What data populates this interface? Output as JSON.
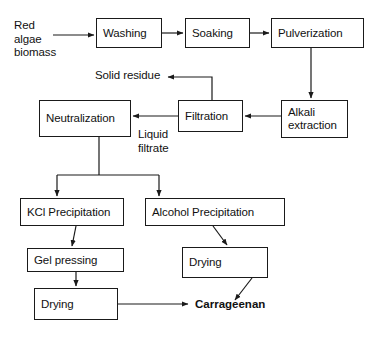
{
  "diagram": {
    "stroke_color": "#1a1a1a",
    "background_color": "#ffffff",
    "nodes": [
      {
        "id": "washing",
        "label": "Washing",
        "x": 96,
        "y": 18,
        "w": 66,
        "h": 30
      },
      {
        "id": "soaking",
        "label": "Soaking",
        "x": 185,
        "y": 18,
        "w": 65,
        "h": 30
      },
      {
        "id": "pulverization",
        "label": "Pulverization",
        "x": 271,
        "y": 18,
        "w": 93,
        "h": 30
      },
      {
        "id": "alkali",
        "label": "Alkali\nextraction",
        "x": 281,
        "y": 100,
        "w": 67,
        "h": 38
      },
      {
        "id": "filtration",
        "label": "Filtration",
        "x": 178,
        "y": 100,
        "w": 65,
        "h": 32
      },
      {
        "id": "neutralization",
        "label": "Neutralization",
        "x": 39,
        "y": 100,
        "w": 92,
        "h": 37
      },
      {
        "id": "kcl-precip",
        "label": "KCl Precipitation",
        "x": 20,
        "y": 198,
        "w": 104,
        "h": 28
      },
      {
        "id": "alcohol-precip",
        "label": "Alcohol Precipitation",
        "x": 145,
        "y": 198,
        "w": 140,
        "h": 28
      },
      {
        "id": "gel-pressing",
        "label": "Gel pressing",
        "x": 27,
        "y": 248,
        "w": 97,
        "h": 24
      },
      {
        "id": "drying-right",
        "label": "Drying",
        "x": 182,
        "y": 247,
        "w": 86,
        "h": 31
      },
      {
        "id": "drying-bottom",
        "label": "Drying",
        "x": 34,
        "y": 288,
        "w": 84,
        "h": 32
      }
    ],
    "labels": [
      {
        "id": "feedstock",
        "text": "Red\nalgae\nbiomass",
        "x": 14,
        "y": 19,
        "bold": false
      },
      {
        "id": "solid-residue",
        "text": "Solid residue",
        "x": 95,
        "y": 69,
        "bold": false
      },
      {
        "id": "liquid-filtrate",
        "text": "Liquid\nfiltrate",
        "x": 138,
        "y": 128,
        "bold": false
      },
      {
        "id": "carrageenan",
        "text": "Carrageenan",
        "x": 195,
        "y": 298,
        "bold": true
      }
    ],
    "edges": [
      {
        "id": "feedstock-to-washing",
        "from": "Red algae biomass",
        "to": "Washing"
      },
      {
        "id": "washing-to-soaking",
        "from": "Washing",
        "to": "Soaking"
      },
      {
        "id": "soaking-to-pulverization",
        "from": "Soaking",
        "to": "Pulverization"
      },
      {
        "id": "pulverization-to-alkali",
        "from": "Pulverization",
        "to": "Alkali extraction"
      },
      {
        "id": "alkali-to-filtration",
        "from": "Alkali extraction",
        "to": "Filtration"
      },
      {
        "id": "filtration-to-solid-residue",
        "from": "Filtration",
        "to": "Solid residue"
      },
      {
        "id": "filtration-to-neutralization",
        "from": "Filtration",
        "to": "Neutralization",
        "label": "Liquid filtrate"
      },
      {
        "id": "neutralization-to-kcl",
        "from": "Neutralization",
        "to": "KCl Precipitation"
      },
      {
        "id": "neutralization-to-alcohol",
        "from": "Neutralization",
        "to": "Alcohol Precipitation"
      },
      {
        "id": "kcl-to-gel-pressing",
        "from": "KCl Precipitation",
        "to": "Gel pressing"
      },
      {
        "id": "gel-pressing-to-drying",
        "from": "Gel pressing",
        "to": "Drying"
      },
      {
        "id": "alcohol-to-drying",
        "from": "Alcohol Precipitation",
        "to": "Drying"
      },
      {
        "id": "drying-bottom-to-product",
        "from": "Drying",
        "to": "Carrageenan"
      },
      {
        "id": "drying-right-to-product",
        "from": "Drying",
        "to": "Carrageenan"
      }
    ]
  }
}
